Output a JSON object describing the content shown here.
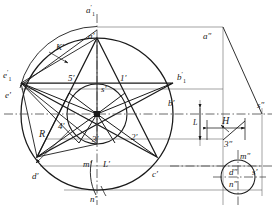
{
  "drawing": {
    "title": "Pentagram projection drawing",
    "stroke_color": "#1a1a1a",
    "thin_color": "#555555",
    "centerline_color": "#444444",
    "background": "#ffffff"
  },
  "labels": {
    "a1_front": {
      "text": "a",
      "prime": "′",
      "sub": "1"
    },
    "a_front": {
      "text": "a′"
    },
    "K_front": {
      "text": "K′"
    },
    "e1_front": {
      "text": "e",
      "prime": "′",
      "sub": "1"
    },
    "e_front": {
      "text": "e′"
    },
    "b1_front": {
      "text": "b",
      "prime": "′",
      "sub": "1"
    },
    "b_front": {
      "text": "b′"
    },
    "p5": {
      "text": "5′"
    },
    "p1": {
      "text": "1′"
    },
    "p2": {
      "text": "2′"
    },
    "p3": {
      "text": "3′"
    },
    "p4": {
      "text": "4′"
    },
    "s_front": {
      "text": "s′"
    },
    "R": {
      "text": "R"
    },
    "m_front": {
      "text": "m′"
    },
    "L_front": {
      "text": "L′"
    },
    "n_front": {
      "text": "n′"
    },
    "d_front": {
      "text": "d′"
    },
    "c_front": {
      "text": "c′"
    },
    "a_side": {
      "text": "a″"
    },
    "s_side": {
      "text": "s″"
    },
    "H": {
      "text": "H"
    },
    "L_side": {
      "text": "L"
    },
    "p3_side": {
      "text": "3″"
    },
    "m_side": {
      "text": "m″"
    },
    "d_side": {
      "text": "d″"
    },
    "n_side": {
      "text": "n″"
    },
    "s_top": {
      "text": "s′"
    }
  },
  "geometry": {
    "front_view": {
      "center_x": 97,
      "center_y": 114,
      "outer_radius": 76,
      "inner_radius": 30,
      "star_points": 5,
      "vertex_labels": [
        "a′",
        "b′",
        "c′",
        "d′",
        "e′"
      ],
      "inner_labels": [
        "1′",
        "2′",
        "3′",
        "4′",
        "5′"
      ]
    },
    "side_view": {
      "apex_x": 223,
      "apex_y": 27,
      "base_x": 262,
      "base_y": 114,
      "small_circle_cx": 238,
      "small_circle_cy": 177,
      "small_circle_r": 17
    },
    "dimensions": {
      "H_label": "H",
      "L_label": "L"
    }
  }
}
